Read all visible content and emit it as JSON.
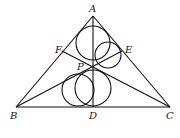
{
  "diagram": {
    "type": "geometry",
    "points": {
      "A": {
        "label": "A",
        "x": 93,
        "y": 16
      },
      "B": {
        "label": "B",
        "x": 16,
        "y": 107
      },
      "C": {
        "label": "C",
        "x": 170,
        "y": 107
      },
      "D": {
        "label": "D",
        "x": 93,
        "y": 107
      },
      "E": {
        "label": "E",
        "x": 122,
        "y": 51
      },
      "F": {
        "label": "F",
        "x": 62,
        "y": 51
      },
      "P": {
        "label": "P",
        "x": 93,
        "y": 67
      }
    },
    "segments": [
      "AB",
      "AC",
      "BC",
      "AD",
      "BE",
      "CF"
    ],
    "circles": [
      {
        "name": "circle-upper-left",
        "cx": 93,
        "cy": 43,
        "r": 17
      },
      {
        "name": "circle-upper-right",
        "cx": 108,
        "cy": 55,
        "r": 13
      },
      {
        "name": "circle-lower-left",
        "cx": 78,
        "cy": 90,
        "r": 16
      },
      {
        "name": "circle-lower-right",
        "cx": 93,
        "cy": 88,
        "r": 18
      }
    ]
  }
}
